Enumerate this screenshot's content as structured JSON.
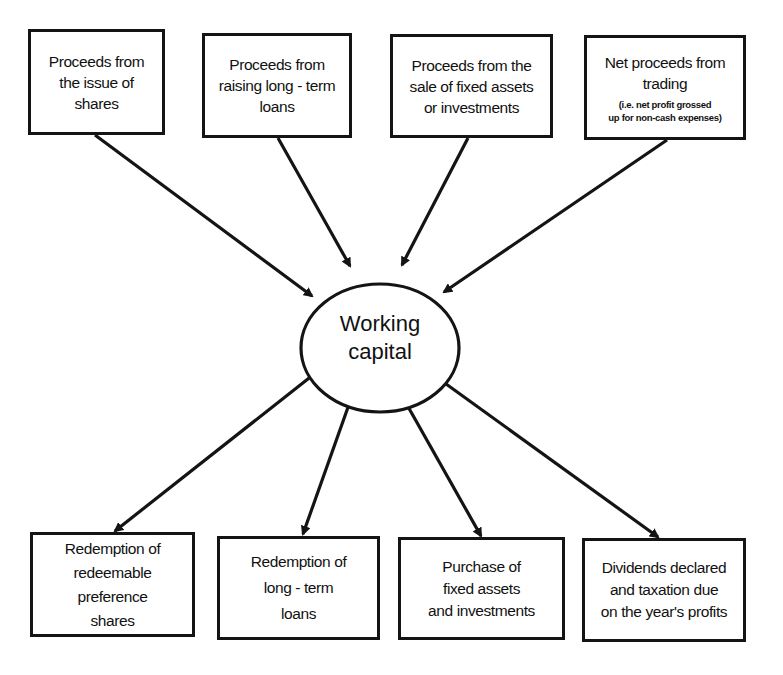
{
  "diagram": {
    "center": {
      "label": "Working\ncapital",
      "shape": "ellipse"
    },
    "inflows": [
      {
        "label": "Proceeds from\nthe issue of\nshares",
        "note": ""
      },
      {
        "label": "Proceeds from\nraising long - term\nloans",
        "note": ""
      },
      {
        "label": "Proceeds from the\nsale of fixed assets\nor investments",
        "note": ""
      },
      {
        "label": "Net proceeds from\ntrading",
        "note": "(i.e. net profit grossed\nup for non-cash expenses)"
      }
    ],
    "outflows": [
      {
        "label": "Redemption of\nredeemable\npreference\nshares"
      },
      {
        "label": "Redemption of\nlong - term\nloans"
      },
      {
        "label": "Purchase of\nfixed assets\nand investments"
      },
      {
        "label": "Dividends declared\nand taxation due\non the year's profits"
      }
    ],
    "edges": [
      {
        "from": "inflows.0",
        "to": "center"
      },
      {
        "from": "inflows.1",
        "to": "center"
      },
      {
        "from": "inflows.2",
        "to": "center"
      },
      {
        "from": "inflows.3",
        "to": "center"
      },
      {
        "from": "center",
        "to": "outflows.0"
      },
      {
        "from": "center",
        "to": "outflows.1"
      },
      {
        "from": "center",
        "to": "outflows.2"
      },
      {
        "from": "center",
        "to": "outflows.3"
      }
    ],
    "colors": {
      "stroke": "#141414",
      "background": "#ffffff"
    }
  }
}
